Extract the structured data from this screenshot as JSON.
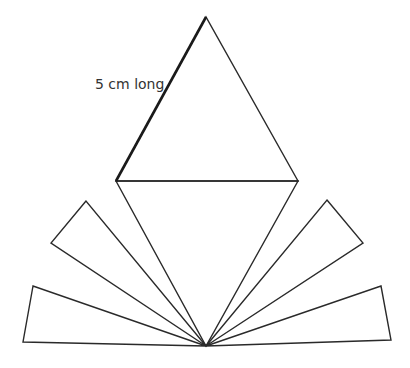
{
  "diagram": {
    "annotation": "5 cm long",
    "stroke_color": "#2a2a2a",
    "background": "#ffffff",
    "shapes": {
      "top_triangle": [
        [
          206,
          17
        ],
        [
          116,
          181
        ],
        [
          298,
          181
        ]
      ],
      "middle_triangle": [
        [
          116,
          181
        ],
        [
          298,
          181
        ],
        [
          206,
          346
        ]
      ],
      "left_upper_triangle": [
        [
          86,
          201
        ],
        [
          51,
          243
        ],
        [
          206,
          346
        ]
      ],
      "left_lower_triangle": [
        [
          33,
          286
        ],
        [
          23,
          342
        ],
        [
          206,
          346
        ]
      ],
      "right_upper_triangle": [
        [
          327,
          200
        ],
        [
          363,
          243
        ],
        [
          206,
          346
        ]
      ],
      "right_lower_triangle": [
        [
          381,
          286
        ],
        [
          391,
          340
        ],
        [
          206,
          346
        ]
      ]
    },
    "highlighted_edge": [
      [
        206,
        17
      ],
      [
        116,
        181
      ]
    ]
  }
}
